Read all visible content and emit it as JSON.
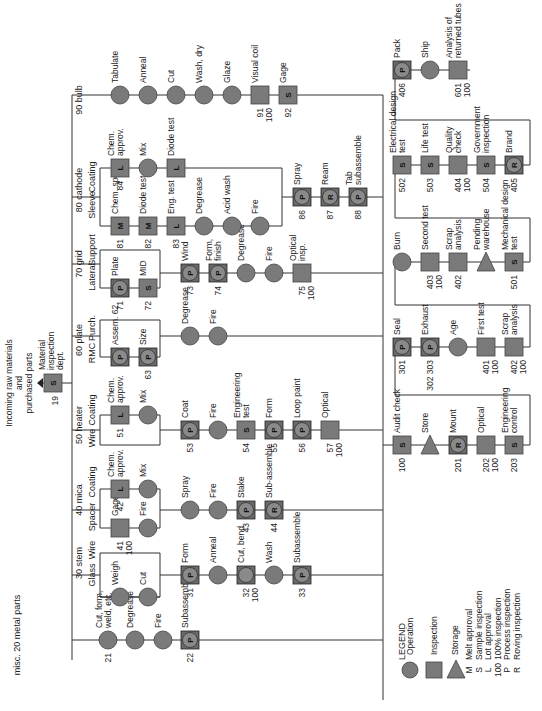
{
  "title_note": "Incoming raw materials and purchased parts",
  "colors": {
    "symbol_fill": "#7a7a7a",
    "line": "#333333",
    "background": "#ffffff"
  },
  "legend": {
    "title": "LEGEND",
    "symbols": [
      {
        "shape": "circle",
        "label": "Operation"
      },
      {
        "shape": "square",
        "label": "Inspection"
      },
      {
        "shape": "triangle",
        "label": "Storage"
      }
    ],
    "codes": [
      {
        "code": "M",
        "label": "Melt approval"
      },
      {
        "code": "S",
        "label": "Sample inspection"
      },
      {
        "code": "L",
        "label": "Lot approval"
      },
      {
        "code": "100",
        "label": "100% inspection"
      },
      {
        "code": "P",
        "label": "Process inspection"
      },
      {
        "code": "R",
        "label": "Roving inspection"
      }
    ]
  },
  "intake": {
    "number": "19",
    "code": "S",
    "label": "Material inspection dept.",
    "note": "Incoming raw materials and purchased parts"
  },
  "headers": [
    {
      "x": 20,
      "y": 635,
      "text": "misc. 20 metal parts"
    },
    {
      "x": 82,
      "y": 563,
      "text": "30 stem"
    },
    {
      "x": 82,
      "y": 500,
      "text": "40 mica"
    },
    {
      "x": 82,
      "y": 425,
      "text": "50 heater"
    },
    {
      "x": 82,
      "y": 340,
      "text": "60 plate"
    },
    {
      "x": 82,
      "y": 264,
      "text": "70 grid"
    },
    {
      "x": 82,
      "y": 190,
      "text": "80 cathode"
    },
    {
      "x": 82,
      "y": 100,
      "text": "90 bulb"
    }
  ],
  "subheaders": [
    {
      "x": 95,
      "y": 575,
      "text": "Glass"
    },
    {
      "x": 95,
      "y": 550,
      "text": "Wire"
    },
    {
      "x": 95,
      "y": 517,
      "text": "Spacer"
    },
    {
      "x": 95,
      "y": 482,
      "text": "Coating"
    },
    {
      "x": 95,
      "y": 438,
      "text": "Wire"
    },
    {
      "x": 95,
      "y": 410,
      "text": "Coating"
    },
    {
      "x": 95,
      "y": 353,
      "text": "RMC"
    },
    {
      "x": 95,
      "y": 328,
      "text": "Purch."
    },
    {
      "x": 95,
      "y": 277,
      "text": "Lateral"
    },
    {
      "x": 95,
      "y": 250,
      "text": "Support"
    },
    {
      "x": 95,
      "y": 205,
      "text": "Sleeve"
    },
    {
      "x": 95,
      "y": 177,
      "text": "Coating"
    }
  ],
  "nodes": [
    {
      "x": 108,
      "y": 640,
      "shape": "circle",
      "label": "Cut, form, weld, etc.",
      "num": "21"
    },
    {
      "x": 135,
      "y": 640,
      "shape": "circle",
      "label": "Degrease"
    },
    {
      "x": 163,
      "y": 640,
      "shape": "circle",
      "label": "Fire"
    },
    {
      "x": 190,
      "y": 640,
      "shape": "combo",
      "code": "P",
      "label": "Subassemble",
      "num": "22"
    },
    {
      "x": 120,
      "y": 597,
      "shape": "circle",
      "label": "Weigh"
    },
    {
      "x": 148,
      "y": 597,
      "shape": "circle",
      "label": "Cut"
    },
    {
      "x": 190,
      "y": 575,
      "shape": "combo",
      "code": "P",
      "label": "Form",
      "num": "31"
    },
    {
      "x": 218,
      "y": 575,
      "shape": "circle",
      "label": "Anneal"
    },
    {
      "x": 246,
      "y": 575,
      "shape": "combo",
      "code": "",
      "label": "Cut, bend",
      "num": "32",
      "num2": "100"
    },
    {
      "x": 274,
      "y": 575,
      "shape": "circle",
      "label": "Wash"
    },
    {
      "x": 302,
      "y": 575,
      "shape": "combo",
      "code": "P",
      "label": "Subassemble",
      "num": "33"
    },
    {
      "x": 120,
      "y": 528,
      "shape": "square",
      "label": "Gage",
      "num": "41",
      "num2": "100"
    },
    {
      "x": 148,
      "y": 528,
      "shape": "circle",
      "label": "Fire"
    },
    {
      "x": 120,
      "y": 489,
      "shape": "square",
      "code": "L",
      "label": "Chem. approv.",
      "num": "42"
    },
    {
      "x": 148,
      "y": 489,
      "shape": "circle",
      "label": "Mix"
    },
    {
      "x": 190,
      "y": 510,
      "shape": "circle",
      "label": "Spray"
    },
    {
      "x": 218,
      "y": 510,
      "shape": "circle",
      "label": "Fire"
    },
    {
      "x": 246,
      "y": 510,
      "shape": "combo",
      "code": "P",
      "label": "Stake",
      "num": "43"
    },
    {
      "x": 274,
      "y": 510,
      "shape": "combo",
      "code": "R",
      "label": "Sub-assemble",
      "num": "44"
    },
    {
      "x": 120,
      "y": 415,
      "shape": "square",
      "code": "L",
      "label": "Chem. approv.",
      "num": "51"
    },
    {
      "x": 148,
      "y": 415,
      "shape": "circle",
      "label": "Mix"
    },
    {
      "x": 190,
      "y": 430,
      "shape": "combo",
      "code": "P",
      "label": "Coat",
      "num": "53"
    },
    {
      "x": 218,
      "y": 430,
      "shape": "circle",
      "label": "Fire"
    },
    {
      "x": 246,
      "y": 430,
      "shape": "square",
      "code": "S",
      "label": "Engineering test",
      "num": "54"
    },
    {
      "x": 274,
      "y": 430,
      "shape": "combo",
      "code": "P",
      "label": "Form",
      "num": "55"
    },
    {
      "x": 302,
      "y": 430,
      "shape": "combo",
      "code": "P",
      "label": "Loop paint",
      "num": "56"
    },
    {
      "x": 330,
      "y": 430,
      "shape": "square",
      "label": "Optical",
      "num": "57",
      "num2": "100"
    },
    {
      "x": 120,
      "y": 357,
      "shape": "combo",
      "code": "P",
      "label": "Assem. 62"
    },
    {
      "x": 148,
      "y": 357,
      "shape": "combo",
      "code": "P",
      "label": "Size",
      "num": "63"
    },
    {
      "x": 190,
      "y": 336,
      "shape": "circle",
      "label": "Degrease"
    },
    {
      "x": 218,
      "y": 336,
      "shape": "circle",
      "label": "Fire"
    },
    {
      "x": 120,
      "y": 288,
      "shape": "combo",
      "code": "P",
      "label": "Plate",
      "num": "71"
    },
    {
      "x": 148,
      "y": 288,
      "shape": "square",
      "code": "S",
      "label": "MID",
      "num": "72"
    },
    {
      "x": 190,
      "y": 273,
      "shape": "combo",
      "code": "P",
      "label": "Wind",
      "num": "73"
    },
    {
      "x": 218,
      "y": 273,
      "shape": "combo",
      "code": "P",
      "label": "Form, finish",
      "num": "74"
    },
    {
      "x": 246,
      "y": 273,
      "shape": "circle",
      "label": "Degrease"
    },
    {
      "x": 274,
      "y": 273,
      "shape": "circle",
      "label": "Fire"
    },
    {
      "x": 302,
      "y": 273,
      "shape": "square",
      "label": "Optical insp.",
      "num": "75",
      "num2": "100"
    },
    {
      "x": 120,
      "y": 226,
      "shape": "square",
      "code": "M",
      "label": "Chem. spec.",
      "num": "81"
    },
    {
      "x": 148,
      "y": 226,
      "shape": "square",
      "code": "M",
      "label": "Diode test",
      "num": "82"
    },
    {
      "x": 176,
      "y": 226,
      "shape": "square",
      "code": "L",
      "label": "Eng. test",
      "num": "83"
    },
    {
      "x": 204,
      "y": 226,
      "shape": "circle",
      "label": "Degrease"
    },
    {
      "x": 232,
      "y": 226,
      "shape": "circle",
      "label": "Acid wash"
    },
    {
      "x": 260,
      "y": 226,
      "shape": "circle",
      "label": "Fire"
    },
    {
      "x": 120,
      "y": 168,
      "shape": "square",
      "code": "L",
      "label": "Chem. approv.",
      "num": "84"
    },
    {
      "x": 148,
      "y": 168,
      "shape": "circle",
      "label": "Mix"
    },
    {
      "x": 176,
      "y": 168,
      "shape": "square",
      "code": "L",
      "label": "Diode test"
    },
    {
      "x": 302,
      "y": 197,
      "shape": "combo",
      "code": "P",
      "label": "Spray",
      "num": "86"
    },
    {
      "x": 330,
      "y": 197,
      "shape": "combo",
      "code": "R",
      "label": "Ream",
      "num": "87"
    },
    {
      "x": 358,
      "y": 197,
      "shape": "combo",
      "code": "P",
      "label": "Tab subassemble",
      "num": "88"
    },
    {
      "x": 120,
      "y": 95,
      "shape": "circle",
      "label": "Tabulate"
    },
    {
      "x": 148,
      "y": 95,
      "shape": "circle",
      "label": "Anneal"
    },
    {
      "x": 176,
      "y": 95,
      "shape": "circle",
      "label": "Cut"
    },
    {
      "x": 204,
      "y": 95,
      "shape": "circle",
      "label": "Wash, dry"
    },
    {
      "x": 232,
      "y": 95,
      "shape": "circle",
      "label": "Glaze"
    },
    {
      "x": 260,
      "y": 95,
      "shape": "square",
      "label": "Visual coil",
      "num": "91",
      "num2": "100"
    },
    {
      "x": 288,
      "y": 95,
      "shape": "square",
      "code": "S",
      "label": "Gage",
      "num": "92"
    },
    {
      "x": 402,
      "y": 445,
      "shape": "square",
      "code": "S",
      "label": "Audit check",
      "num": "100"
    },
    {
      "x": 430,
      "y": 445,
      "shape": "triangle",
      "label": "Store"
    },
    {
      "x": 458,
      "y": 445,
      "shape": "combo",
      "code": "R",
      "label": "Mount",
      "num": "201"
    },
    {
      "x": 486,
      "y": 445,
      "shape": "square",
      "label": "Optical",
      "num": "202",
      "num2": "100"
    },
    {
      "x": 514,
      "y": 445,
      "shape": "square",
      "code": "S",
      "label": "Engineering control",
      "num": "203"
    },
    {
      "x": 402,
      "y": 347,
      "shape": "combo",
      "code": "P",
      "label": "Seal",
      "num": "301"
    },
    {
      "x": 430,
      "y": 347,
      "shape": "combo",
      "code": "P",
      "label": "Exhaust",
      "num": "302 303"
    },
    {
      "x": 458,
      "y": 347,
      "shape": "circle",
      "label": "Age"
    },
    {
      "x": 486,
      "y": 347,
      "shape": "square",
      "label": "First test",
      "num": "401",
      "num2": "100"
    },
    {
      "x": 514,
      "y": 347,
      "shape": "square",
      "label": "Scrap analysis",
      "num": "402",
      "num2": "100"
    },
    {
      "x": 402,
      "y": 262,
      "shape": "circle",
      "label": "Burn"
    },
    {
      "x": 430,
      "y": 262,
      "shape": "square",
      "label": "Second test",
      "num": "403",
      "num2": "100"
    },
    {
      "x": 458,
      "y": 262,
      "shape": "square",
      "label": "Scrap analysis",
      "num": "402"
    },
    {
      "x": 486,
      "y": 262,
      "shape": "triangle",
      "label": "Pending warehouse"
    },
    {
      "x": 514,
      "y": 262,
      "shape": "square",
      "code": "S",
      "label": "Mechanical design test",
      "num": "501"
    },
    {
      "x": 402,
      "y": 165,
      "shape": "square",
      "code": "S",
      "label": "Electrical design test",
      "num": "502"
    },
    {
      "x": 430,
      "y": 165,
      "shape": "square",
      "code": "S",
      "label": "Life test",
      "num": "503"
    },
    {
      "x": 458,
      "y": 165,
      "shape": "square",
      "label": "Quality check",
      "num": "404",
      "num2": "100"
    },
    {
      "x": 486,
      "y": 165,
      "shape": "square",
      "code": "S",
      "label": "Government inspection",
      "num": "504"
    },
    {
      "x": 514,
      "y": 165,
      "shape": "combo",
      "code": "R",
      "label": "Brand",
      "num": "405"
    },
    {
      "x": 402,
      "y": 70,
      "shape": "combo",
      "code": "P",
      "label": "Pack",
      "num": "406"
    },
    {
      "x": 430,
      "y": 70,
      "shape": "circle",
      "label": "Ship"
    },
    {
      "x": 458,
      "y": 70,
      "shape": "square",
      "label": "Analysis of returned tubes",
      "num": "601",
      "num2": "100"
    }
  ]
}
